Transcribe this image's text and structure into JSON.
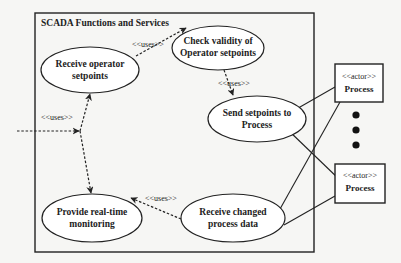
{
  "diagram": {
    "type": "uml-use-case",
    "system_boundary": {
      "title": "SCADA Functions  and Services"
    },
    "use_cases": [
      {
        "id": "receive-operator-setpoints",
        "lines": [
          "Receive operator",
          "setpoints"
        ]
      },
      {
        "id": "check-validity",
        "lines": [
          "Check validity of",
          "Operator setpoints"
        ]
      },
      {
        "id": "send-setpoints",
        "lines": [
          "Send setpoints to",
          "Process"
        ]
      },
      {
        "id": "provide-monitoring",
        "lines": [
          "Provide real-time",
          "monitoring"
        ]
      },
      {
        "id": "receive-changed-data",
        "lines": [
          "Receive changed",
          "process data"
        ]
      }
    ],
    "actors": [
      {
        "id": "process-1",
        "stereotype": "<<actor>>",
        "name": "Process"
      },
      {
        "id": "process-2",
        "stereotype": "<<actor>>",
        "name": "Process"
      }
    ],
    "relationships": {
      "uses_label": "<<uses>>"
    },
    "colors": {
      "line": "#222222",
      "background": "#f6f6f4",
      "shape_fill": "#ffffff"
    }
  }
}
